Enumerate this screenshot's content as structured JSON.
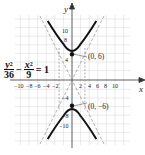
{
  "diagram": {
    "type": "hyperbola-graph",
    "equation": {
      "term1_num": "y",
      "term1_exp": "2",
      "term1_den": "36",
      "op": "−",
      "term2_num": "x",
      "term2_exp": "2",
      "term2_den": "9",
      "rhs": "= 1"
    },
    "axes": {
      "x_label": "x",
      "y_label": "y",
      "x_ticks": [
        "−10",
        "−8",
        "−6",
        "−4",
        "−2",
        "2",
        "4",
        "6",
        "8",
        "10"
      ],
      "y_ticks": [
        "10",
        "8",
        "4",
        "−4",
        "−8",
        "−10"
      ]
    },
    "vertices": [
      {
        "label": "(0, 6)",
        "x": 0,
        "y": 6
      },
      {
        "label": "(0, −6)",
        "x": 0,
        "y": -6
      }
    ],
    "asymptotes": [
      "y = 2x",
      "y = −2x"
    ],
    "fundamental_box": {
      "x": [
        -3,
        3
      ],
      "y": [
        -6,
        6
      ]
    },
    "colors": {
      "curve": "#111111",
      "grid": "#d8d8d8",
      "axis": "#333333",
      "dashed": "#777777"
    }
  }
}
